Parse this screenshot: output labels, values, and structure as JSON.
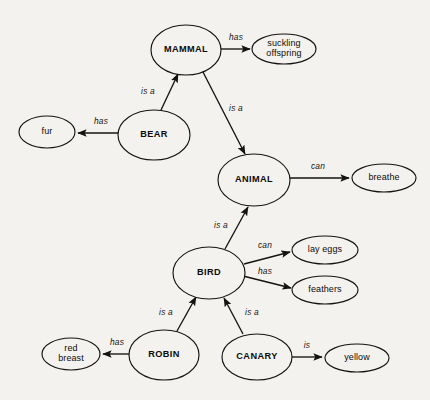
{
  "diagram": {
    "type": "semantic-network",
    "background_color": "#f4f2ee",
    "stroke_color": "#15130f",
    "nodes": [
      {
        "id": "mammal",
        "label": "MAMMAL",
        "kind": "concept",
        "cx": 186,
        "cy": 50,
        "rx": 35,
        "ry": 25
      },
      {
        "id": "suckling",
        "label": "suckling offspring",
        "kind": "property",
        "cx": 284,
        "cy": 49,
        "rx": 32,
        "ry": 15,
        "lines": [
          "suckling",
          "offspring"
        ]
      },
      {
        "id": "bear",
        "label": "BEAR",
        "kind": "concept",
        "cx": 154,
        "cy": 135,
        "rx": 36,
        "ry": 25
      },
      {
        "id": "fur",
        "label": "fur",
        "kind": "property",
        "cx": 47,
        "cy": 132,
        "rx": 28,
        "ry": 16,
        "lines": [
          "fur"
        ]
      },
      {
        "id": "animal",
        "label": "ANIMAL",
        "kind": "concept",
        "cx": 254,
        "cy": 180,
        "rx": 36,
        "ry": 26
      },
      {
        "id": "breathe",
        "label": "breathe",
        "kind": "property",
        "cx": 384,
        "cy": 178,
        "rx": 32,
        "ry": 14,
        "lines": [
          "breathe"
        ]
      },
      {
        "id": "bird",
        "label": "BIRD",
        "kind": "concept",
        "cx": 209,
        "cy": 273,
        "rx": 36,
        "ry": 26
      },
      {
        "id": "layeggs",
        "label": "lay eggs",
        "kind": "property",
        "cx": 325,
        "cy": 250,
        "rx": 33,
        "ry": 14,
        "lines": [
          "lay eggs"
        ]
      },
      {
        "id": "feathers",
        "label": "feathers",
        "kind": "property",
        "cx": 325,
        "cy": 290,
        "rx": 33,
        "ry": 14,
        "lines": [
          "feathers"
        ]
      },
      {
        "id": "robin",
        "label": "ROBIN",
        "kind": "concept",
        "cx": 164,
        "cy": 355,
        "rx": 35,
        "ry": 25
      },
      {
        "id": "redbreast",
        "label": "red breast",
        "kind": "property",
        "cx": 71,
        "cy": 354,
        "rx": 29,
        "ry": 16,
        "lines": [
          "red",
          "breast"
        ]
      },
      {
        "id": "canary",
        "label": "CANARY",
        "kind": "concept",
        "cx": 257,
        "cy": 357,
        "rx": 35,
        "ry": 23
      },
      {
        "id": "yellow",
        "label": "yellow",
        "kind": "property",
        "cx": 357,
        "cy": 358,
        "rx": 32,
        "ry": 14,
        "lines": [
          "yellow"
        ]
      }
    ],
    "edges": [
      {
        "id": "mammal-has-suckling",
        "from": "mammal",
        "to": "suckling",
        "label": "has",
        "x1": 221,
        "y1": 49,
        "x2": 250,
        "y2": 49,
        "lx": 236,
        "ly": 38
      },
      {
        "id": "bear-isa-mammal",
        "from": "bear",
        "to": "mammal",
        "label": "is a",
        "x1": 161,
        "y1": 110,
        "x2": 178,
        "y2": 74,
        "lx": 148,
        "ly": 92
      },
      {
        "id": "bear-has-fur",
        "from": "bear",
        "to": "fur",
        "label": "has",
        "x1": 118,
        "y1": 133,
        "x2": 78,
        "y2": 133,
        "lx": 101,
        "ly": 122
      },
      {
        "id": "mammal-isa-animal",
        "from": "mammal",
        "to": "animal",
        "label": "is a",
        "x1": 203,
        "y1": 72,
        "x2": 245,
        "y2": 154,
        "lx": 236,
        "ly": 109
      },
      {
        "id": "animal-can-breathe",
        "from": "animal",
        "to": "breathe",
        "label": "can",
        "x1": 290,
        "y1": 178,
        "x2": 349,
        "y2": 178,
        "lx": 318,
        "ly": 167
      },
      {
        "id": "bird-isa-animal",
        "from": "bird",
        "to": "animal",
        "label": "is a",
        "x1": 225,
        "y1": 249,
        "x2": 248,
        "y2": 207,
        "lx": 221,
        "ly": 226
      },
      {
        "id": "bird-can-layeggs",
        "from": "bird",
        "to": "layeggs",
        "label": "can",
        "x1": 244,
        "y1": 264,
        "x2": 290,
        "y2": 252,
        "lx": 265,
        "ly": 246
      },
      {
        "id": "bird-has-feathers",
        "from": "bird",
        "to": "feathers",
        "label": "has",
        "x1": 243,
        "y1": 276,
        "x2": 291,
        "y2": 288,
        "lx": 265,
        "ly": 272
      },
      {
        "id": "robin-isa-bird",
        "from": "robin",
        "to": "bird",
        "label": "is a",
        "x1": 177,
        "y1": 331,
        "x2": 196,
        "y2": 297,
        "lx": 166,
        "ly": 313
      },
      {
        "id": "robin-has-redbreast",
        "from": "robin",
        "to": "redbreast",
        "label": "has",
        "x1": 129,
        "y1": 354,
        "x2": 103,
        "y2": 354,
        "lx": 117,
        "ly": 343
      },
      {
        "id": "canary-isa-bird",
        "from": "canary",
        "to": "bird",
        "label": "is a",
        "x1": 243,
        "y1": 334,
        "x2": 224,
        "y2": 298,
        "lx": 252,
        "ly": 313
      },
      {
        "id": "canary-is-yellow",
        "from": "canary",
        "to": "yellow",
        "label": "is",
        "x1": 292,
        "y1": 357,
        "x2": 322,
        "y2": 357,
        "lx": 307,
        "ly": 346
      }
    ]
  }
}
